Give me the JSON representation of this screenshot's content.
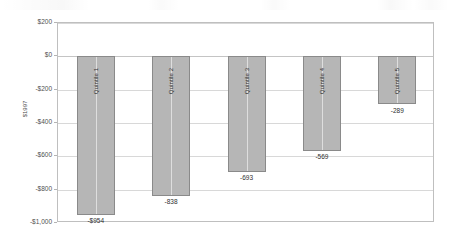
{
  "chart_data": {
    "type": "bar",
    "title": "",
    "subtitle": "",
    "xlabel": "",
    "ylabel": "$1997",
    "categories": [
      "Quintile 1",
      "Quintile 2",
      "Quintile 3",
      "Quintile 4",
      "Quintile 5"
    ],
    "values": [
      -954,
      -838,
      -693,
      -569,
      -289
    ],
    "data_labels": [
      "-$954",
      "-838",
      "-693",
      "-569",
      "-289"
    ],
    "ylim": [
      -1000,
      200
    ],
    "y_ticks": [
      200,
      0,
      -200,
      -400,
      -600,
      -800,
      -1000
    ],
    "y_tick_labels": [
      "$200",
      "$0",
      "-$200",
      "-$400",
      "-$600",
      "-$800",
      "-$1,000"
    ],
    "grid": true,
    "legend": false,
    "legend_position": "none",
    "bar_color": "#b6b6b6",
    "bar_border_color": "#8a8a8a",
    "gridline_color": "#d8d8d8",
    "plot_border_color": "#bfbfbf",
    "text_color": "#2f2f2f"
  }
}
